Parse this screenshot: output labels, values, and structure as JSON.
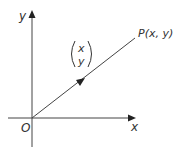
{
  "diagram": {
    "type": "position-vector",
    "colors": {
      "stroke": "#444444",
      "text": "#333333",
      "background": "#ffffff"
    },
    "axes": {
      "origin_label": "O",
      "x_label": "x",
      "y_label": "y"
    },
    "point": {
      "label": "P(x, y)"
    },
    "vector": {
      "top": "x",
      "bottom": "y"
    }
  }
}
